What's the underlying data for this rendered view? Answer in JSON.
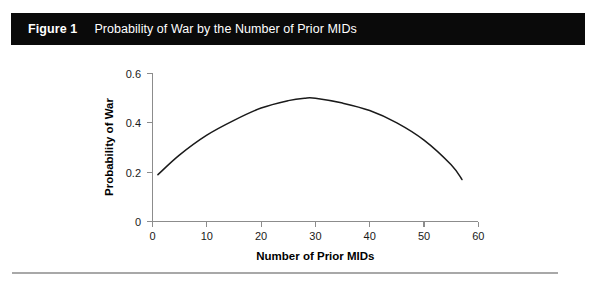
{
  "figure": {
    "number_label": "Figure 1",
    "title": "Probability of War by the Number of Prior MIDs"
  },
  "colors": {
    "caption_bar_background": "#0a0a0a",
    "caption_text": "#ffffff",
    "axis": "#8c8c8c",
    "curve": "#1a1a1a",
    "rule": "#a8a8a8",
    "page_background": "#ffffff"
  },
  "chart_data": {
    "type": "line",
    "title": "Probability of War by the Number of Prior MIDs",
    "xlabel": "Number of Prior MIDs",
    "ylabel": "Probability of War",
    "xlim": [
      0,
      60
    ],
    "ylim": [
      0,
      0.6
    ],
    "xticks": [
      0,
      10,
      20,
      30,
      40,
      50,
      60
    ],
    "xtick_labels": [
      "0",
      "10",
      "20",
      "30",
      "40",
      "50",
      "60"
    ],
    "yticks": [
      0,
      0.2,
      0.4,
      0.6
    ],
    "ytick_labels": [
      "0",
      "0.2",
      "0.4",
      "0.6"
    ],
    "grid": false,
    "legend": false,
    "series": [
      {
        "name": "Probability of War",
        "x": [
          1,
          5,
          10,
          15,
          20,
          25,
          28,
          30,
          35,
          40,
          45,
          50,
          55,
          57
        ],
        "values": [
          0.19,
          0.27,
          0.35,
          0.41,
          0.46,
          0.49,
          0.5,
          0.5,
          0.48,
          0.45,
          0.4,
          0.33,
          0.23,
          0.17
        ]
      }
    ],
    "annotations": {
      "peak_x": 28,
      "peak_y": 0.5,
      "shape": "inverted-parabola"
    }
  }
}
